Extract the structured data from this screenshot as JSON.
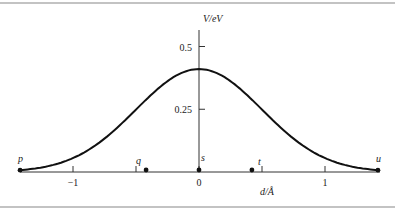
{
  "chart_data": {
    "type": "line",
    "title": "",
    "xlabel": "d/Å",
    "ylabel": "V/eV",
    "x_ticks": [
      -1,
      -0.5,
      0,
      0.5,
      1
    ],
    "x_tick_labels": [
      "−1",
      "",
      "0",
      "",
      "1"
    ],
    "y_ticks": [
      0.25,
      0.5
    ],
    "y_tick_labels": [
      "0.25",
      "0.5"
    ],
    "xlim": [
      -1.45,
      1.45
    ],
    "ylim": [
      0,
      0.55
    ],
    "grid": false,
    "series": [
      {
        "name": "potential",
        "x": [
          -1.42,
          -1.2,
          -1.0,
          -0.8,
          -0.6,
          -0.42,
          -0.2,
          0,
          0.2,
          0.42,
          0.6,
          0.8,
          1.0,
          1.2,
          1.42
        ],
        "y": [
          0.01,
          0.03,
          0.07,
          0.13,
          0.2,
          0.28,
          0.37,
          0.41,
          0.37,
          0.28,
          0.2,
          0.13,
          0.07,
          0.03,
          0.01
        ]
      }
    ],
    "points": [
      {
        "label": "p",
        "x": -1.42,
        "y": 0.01
      },
      {
        "label": "q",
        "x": -0.42,
        "y": 0.28
      },
      {
        "label": "s",
        "x": 0,
        "y": 0.41
      },
      {
        "label": "t",
        "x": 0.42,
        "y": 0.28
      },
      {
        "label": "u",
        "x": 1.42,
        "y": 0.01
      }
    ]
  }
}
